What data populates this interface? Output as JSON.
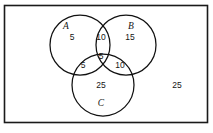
{
  "diagram": {
    "type": "venn-3-set",
    "universe": {
      "label": "",
      "outside_count": "25",
      "border_color": "#1a1a1a",
      "background_color": "#ffffff"
    },
    "sets": [
      {
        "id": "A",
        "label": "A",
        "label_x": 66,
        "label_y": 27,
        "cx": 80,
        "cy": 45,
        "r": 30
      },
      {
        "id": "B",
        "label": "B",
        "label_x": 131,
        "label_y": 27,
        "cx": 126,
        "cy": 45,
        "r": 30
      },
      {
        "id": "C",
        "label": "C",
        "label_x": 101,
        "label_y": 104,
        "cx": 103,
        "cy": 85,
        "r": 31
      }
    ],
    "regions": [
      {
        "id": "A-only",
        "label": "5",
        "x": 72,
        "y": 38
      },
      {
        "id": "B-only",
        "label": "15",
        "x": 130,
        "y": 38
      },
      {
        "id": "A-and-B",
        "label": "10",
        "x": 101,
        "y": 38
      },
      {
        "id": "A-and-C",
        "label": "5",
        "x": 83,
        "y": 66
      },
      {
        "id": "B-and-C",
        "label": "10",
        "x": 120,
        "y": 66
      },
      {
        "id": "A-B-C",
        "label": "5",
        "x": 101,
        "y": 57
      },
      {
        "id": "C-only",
        "label": "25",
        "x": 101,
        "y": 86
      },
      {
        "id": "outside",
        "label": "25",
        "x": 177,
        "y": 86
      }
    ],
    "stroke_color": "#111111",
    "text_color": "#151515"
  }
}
